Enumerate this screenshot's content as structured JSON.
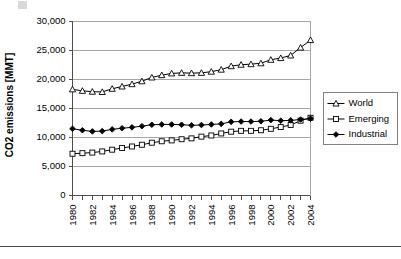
{
  "chart_data": {
    "type": "line",
    "title": "",
    "xlabel": "",
    "ylabel": "CO2 emissions [MMT]",
    "ylim": [
      0,
      30000
    ],
    "xlim": [
      1980,
      2004
    ],
    "grid": true,
    "legend_position": "right",
    "ytick_labels": [
      "0",
      "5,000",
      "10,000",
      "15,000",
      "20,000",
      "25,000",
      "30,000"
    ],
    "ytick_values": [
      0,
      5000,
      10000,
      15000,
      20000,
      25000,
      30000
    ],
    "xtick_labels": [
      "1980",
      "1982",
      "1984",
      "1986",
      "1988",
      "1990",
      "1992",
      "1994",
      "1996",
      "1998",
      "2000",
      "2002",
      "2004"
    ],
    "xtick_values": [
      1980,
      1982,
      1984,
      1986,
      1988,
      1990,
      1992,
      1994,
      1996,
      1998,
      2000,
      2002,
      2004
    ],
    "x": [
      1980,
      1981,
      1982,
      1983,
      1984,
      1985,
      1986,
      1987,
      1988,
      1989,
      1990,
      1991,
      1992,
      1993,
      1994,
      1995,
      1996,
      1997,
      1998,
      1999,
      2000,
      2001,
      2002,
      2003,
      2004
    ],
    "series": [
      {
        "name": "World",
        "marker": "open-triangle",
        "values": [
          18300,
          18050,
          17900,
          17850,
          18400,
          18800,
          19200,
          19700,
          20350,
          20750,
          21050,
          21150,
          21100,
          21150,
          21350,
          21700,
          22300,
          22550,
          22650,
          22800,
          23400,
          23700,
          24150,
          25500,
          26800
        ]
      },
      {
        "name": "Emerging",
        "marker": "open-square",
        "values": [
          7200,
          7300,
          7400,
          7600,
          7900,
          8200,
          8450,
          8750,
          9100,
          9350,
          9500,
          9700,
          9850,
          10150,
          10350,
          10700,
          11000,
          11150,
          11150,
          11250,
          11500,
          11800,
          12150,
          12900,
          13400
        ]
      },
      {
        "name": "Industrial",
        "marker": "filled-diamond",
        "values": [
          11500,
          11250,
          11050,
          11100,
          11400,
          11600,
          11750,
          11950,
          12200,
          12250,
          12250,
          12200,
          12100,
          12150,
          12250,
          12350,
          12700,
          12750,
          12750,
          12800,
          13000,
          12900,
          12950,
          13100,
          13250
        ]
      }
    ]
  },
  "legend": {
    "items": [
      {
        "label": "World",
        "marker": "open-triangle"
      },
      {
        "label": "Emerging",
        "marker": "open-square"
      },
      {
        "label": "Industrial",
        "marker": "filled-diamond"
      }
    ]
  }
}
